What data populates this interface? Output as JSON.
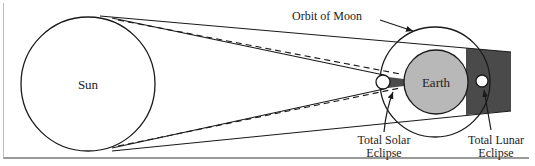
{
  "diagram": {
    "labels": {
      "sun": "Sun",
      "earth": "Earth",
      "orbit": "Orbit of Moon",
      "solar_line1": "Total Solar",
      "solar_line2": "Eclipse",
      "lunar_line1": "Total Lunar",
      "lunar_line2": "Eclipse"
    },
    "colors": {
      "stroke": "#1a1a1a",
      "earth_fill": "#b8b8b8",
      "umbra_fill": "#4a4a4a",
      "background": "#ffffff"
    }
  }
}
